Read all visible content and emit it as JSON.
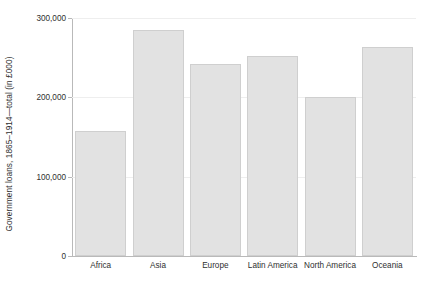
{
  "chart_data": {
    "type": "bar",
    "title": "",
    "xlabel": "",
    "ylabel": "Government loans, 1865–1914—total (in £000)",
    "categories": [
      "Africa",
      "Asia",
      "Europe",
      "Latin America",
      "North America",
      "Oceania"
    ],
    "values": [
      158000,
      285000,
      242000,
      252000,
      200000,
      263000
    ],
    "ylim": [
      0,
      300000
    ],
    "ytick_values": [
      0,
      100000,
      200000,
      300000
    ],
    "ytick_labels": [
      "0",
      "100,000",
      "200,000",
      "300,000"
    ],
    "grid": true,
    "legend": null,
    "bar_color": "#e2e2e2",
    "bar_border_color": "#cfcfcf",
    "axis_color": "#b9b9b9",
    "gridline_color": "#eeeeee",
    "background_color": "#ffffff",
    "text_color": "#2f2f2f"
  }
}
